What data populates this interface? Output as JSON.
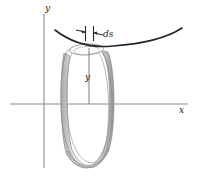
{
  "figure": {
    "labels": {
      "y_axis": "y",
      "x_axis": "x",
      "y_height": "y",
      "ds": "ds"
    },
    "colors": {
      "axis": "#8c8c8c",
      "curve": "#2b2b2b",
      "band_outline": "#8a8a8a",
      "band_fill_light": "#fbfbfb",
      "band_fill_mid": "#d8d8d8",
      "band_fill_dark": "#9e9e9e",
      "leader": "#3a3a3a",
      "background": "#ffffff"
    },
    "geometry": {
      "origin": {
        "x": 44,
        "y": 104
      },
      "x_axis_span": [
        10,
        188
      ],
      "y_axis_span": [
        14,
        168
      ],
      "curve_endpoints": [
        [
          55,
          30
        ],
        [
          182,
          28
        ]
      ],
      "curve_vertex": {
        "x": 112,
        "y": 46
      },
      "ring_top_center": {
        "x": 89,
        "y": 48
      },
      "ring_bottom_center": {
        "x": 89,
        "y": 158
      },
      "ring_rx": 25,
      "ring_ry": 9,
      "band_width": 5,
      "ds_ticks_x": [
        85,
        93
      ],
      "ds_ticks_y_span": [
        26,
        41
      ],
      "height_line": {
        "x": 89,
        "y_top": 48,
        "y_bottom": 104
      }
    }
  }
}
